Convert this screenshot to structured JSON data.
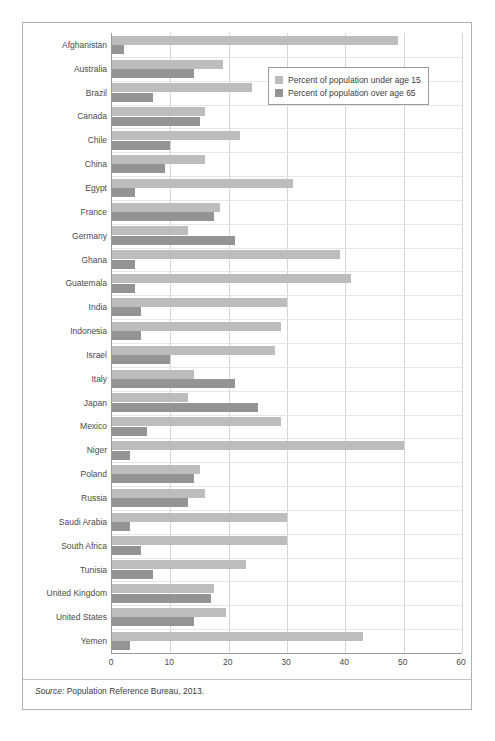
{
  "chart_data": {
    "type": "bar",
    "orientation": "horizontal",
    "title": "",
    "xlabel": "",
    "ylabel": "",
    "xlim": [
      0,
      60
    ],
    "xticks": [
      0,
      10,
      20,
      30,
      40,
      50,
      60
    ],
    "grid": true,
    "legend_position": "top-right",
    "categories": [
      "Afghanistan",
      "Australia",
      "Brazil",
      "Canada",
      "Chile",
      "China",
      "Egypt",
      "France",
      "Germany",
      "Ghana",
      "Guatemala",
      "India",
      "Indonesia",
      "Israel",
      "Italy",
      "Japan",
      "Mexico",
      "Niger",
      "Poland",
      "Russia",
      "Saudi Arabia",
      "South Africa",
      "Tunisia",
      "United Kingdom",
      "United States",
      "Yemen"
    ],
    "series": [
      {
        "name": "Percent of population under age 15",
        "color": "#bdbdbd",
        "values": [
          49,
          19,
          24,
          16,
          22,
          16,
          31,
          18.5,
          13,
          39,
          41,
          30,
          29,
          28,
          14,
          13,
          29,
          50,
          15,
          16,
          30,
          30,
          23,
          17.5,
          19.5,
          43
        ]
      },
      {
        "name": "Percent of population over age 65",
        "color": "#949494",
        "values": [
          2,
          14,
          7,
          15,
          10,
          9,
          4,
          17.5,
          21,
          4,
          4,
          5,
          5,
          10,
          21,
          25,
          6,
          3,
          14,
          13,
          3,
          5,
          7,
          17,
          14,
          3
        ]
      }
    ]
  },
  "legend": {
    "items": [
      {
        "label": "Percent of population under age 15",
        "color": "#bdbdbd"
      },
      {
        "label": "Percent of population over age 65",
        "color": "#949494"
      }
    ]
  },
  "source": {
    "label": "Source:",
    "text": "Population Reference Bureau, 2013."
  }
}
